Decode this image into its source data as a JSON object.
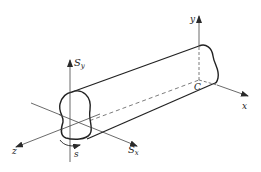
{
  "diagram": {
    "title": "",
    "labels": {
      "Sy_main": "S",
      "Sy_sub": "y",
      "Sx_main": "S",
      "Sx_sub": "x",
      "z": "z",
      "s": "s",
      "y": "y",
      "x": "x",
      "C": "C"
    },
    "colors": {
      "stroke": "#2a2a2a",
      "background": "#ffffff"
    }
  }
}
